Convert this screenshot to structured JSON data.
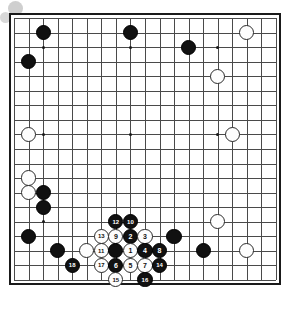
{
  "diagram": {
    "board_size": 19,
    "geometry": {
      "origin_x": 14,
      "origin_y": 18,
      "spacing": 14.55,
      "stone_radius": 7.6,
      "border_pad": 5
    },
    "star_points": [
      {
        "col": 3,
        "row": 3
      },
      {
        "col": 9,
        "row": 3
      },
      {
        "col": 15,
        "row": 3
      },
      {
        "col": 3,
        "row": 9
      },
      {
        "col": 9,
        "row": 9
      },
      {
        "col": 15,
        "row": 9
      },
      {
        "col": 3,
        "row": 15
      },
      {
        "col": 9,
        "row": 15
      },
      {
        "col": 15,
        "row": 15
      }
    ],
    "decorations": [
      {
        "name": "deco-circle-large",
        "x": 8,
        "y": 1,
        "size": 15,
        "color": "#cfcfcf"
      },
      {
        "name": "deco-circle-small",
        "x": 0,
        "y": 12,
        "size": 11,
        "color": "#d8d8d8"
      }
    ],
    "colors": {
      "black_stone": "#111111",
      "white_stone": "#fdfdfd",
      "grid": "#4a4a4a",
      "border": "#1a1a1a",
      "board_bg": "#ffffff"
    },
    "markers": [
      {
        "label": "A",
        "col": 10,
        "row": 16,
        "name": "point-marker-a"
      }
    ],
    "stones": [
      {
        "color": "black",
        "col": 3,
        "row": 2,
        "label": ""
      },
      {
        "color": "black",
        "col": 9,
        "row": 2,
        "label": ""
      },
      {
        "color": "white",
        "col": 17,
        "row": 2,
        "label": ""
      },
      {
        "color": "black",
        "col": 13,
        "row": 3,
        "label": ""
      },
      {
        "color": "black",
        "col": 2,
        "row": 4,
        "label": ""
      },
      {
        "color": "white",
        "col": 15,
        "row": 5,
        "label": ""
      },
      {
        "color": "white",
        "col": 2,
        "row": 9,
        "label": ""
      },
      {
        "color": "white",
        "col": 16,
        "row": 9,
        "label": ""
      },
      {
        "color": "white",
        "col": 2,
        "row": 12,
        "label": ""
      },
      {
        "color": "white",
        "col": 2,
        "row": 13,
        "label": ""
      },
      {
        "color": "black",
        "col": 3,
        "row": 13,
        "label": ""
      },
      {
        "color": "black",
        "col": 3,
        "row": 14,
        "label": ""
      },
      {
        "color": "black",
        "col": 2,
        "row": 16,
        "label": ""
      },
      {
        "color": "black",
        "col": 4,
        "row": 17,
        "label": ""
      },
      {
        "color": "white",
        "col": 6,
        "row": 17,
        "label": ""
      },
      {
        "color": "black",
        "col": 12,
        "row": 16,
        "label": ""
      },
      {
        "color": "white",
        "col": 15,
        "row": 15,
        "label": ""
      },
      {
        "color": "black",
        "col": 14,
        "row": 17,
        "label": ""
      },
      {
        "color": "white",
        "col": 17,
        "row": 17,
        "label": ""
      },
      {
        "color": "black",
        "col": 8,
        "row": 15,
        "label": "12"
      },
      {
        "color": "black",
        "col": 9,
        "row": 15,
        "label": "10"
      },
      {
        "color": "white",
        "col": 7,
        "row": 16,
        "label": "13"
      },
      {
        "color": "white",
        "col": 8,
        "row": 16,
        "label": "9"
      },
      {
        "color": "black",
        "col": 9,
        "row": 16,
        "label": "2"
      },
      {
        "color": "white",
        "col": 10,
        "row": 16,
        "label": "3"
      },
      {
        "color": "white",
        "col": 7,
        "row": 17,
        "label": "11"
      },
      {
        "color": "black",
        "col": 8,
        "row": 17,
        "label": ""
      },
      {
        "color": "white",
        "col": 9,
        "row": 17,
        "label": "1"
      },
      {
        "color": "black",
        "col": 10,
        "row": 17,
        "label": "4"
      },
      {
        "color": "black",
        "col": 11,
        "row": 17,
        "label": "8"
      },
      {
        "color": "white",
        "col": 7,
        "row": 18,
        "label": "17"
      },
      {
        "color": "black",
        "col": 8,
        "row": 18,
        "label": "6"
      },
      {
        "color": "white",
        "col": 9,
        "row": 18,
        "label": "5"
      },
      {
        "color": "white",
        "col": 10,
        "row": 18,
        "label": "7"
      },
      {
        "color": "black",
        "col": 11,
        "row": 18,
        "label": "14"
      },
      {
        "color": "black",
        "col": 5,
        "row": 18,
        "label": "18"
      },
      {
        "color": "white",
        "col": 8,
        "row": 19,
        "label": "15"
      },
      {
        "color": "black",
        "col": 10,
        "row": 19,
        "label": "16"
      }
    ]
  }
}
